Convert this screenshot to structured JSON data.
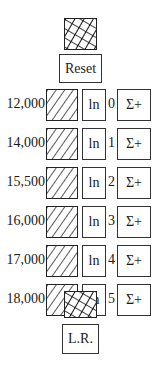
{
  "top": {
    "hatch_icon": "crosshatch-square",
    "reset_label": "Reset"
  },
  "rows": [
    {
      "value": "12,000",
      "hatch_icon": "diagonal-hatch-square",
      "ln_label": "ln",
      "index": "0",
      "sum_label": "Σ+"
    },
    {
      "value": "14,000",
      "hatch_icon": "diagonal-hatch-square",
      "ln_label": "ln",
      "index": "1",
      "sum_label": "Σ+"
    },
    {
      "value": "15,500",
      "hatch_icon": "diagonal-hatch-square",
      "ln_label": "ln",
      "index": "2",
      "sum_label": "Σ+"
    },
    {
      "value": "16,000",
      "hatch_icon": "diagonal-hatch-square",
      "ln_label": "ln",
      "index": "3",
      "sum_label": "Σ+"
    },
    {
      "value": "17,000",
      "hatch_icon": "diagonal-hatch-square",
      "ln_label": "ln",
      "index": "4",
      "sum_label": "Σ+"
    },
    {
      "value": "18,000",
      "hatch_icon": "diagonal-hatch-square",
      "ln_label": "ln",
      "index": "5",
      "sum_label": "Σ+"
    }
  ],
  "bottom": {
    "hatch_icon": "crosshatch-square",
    "lr_label": "L.R."
  }
}
